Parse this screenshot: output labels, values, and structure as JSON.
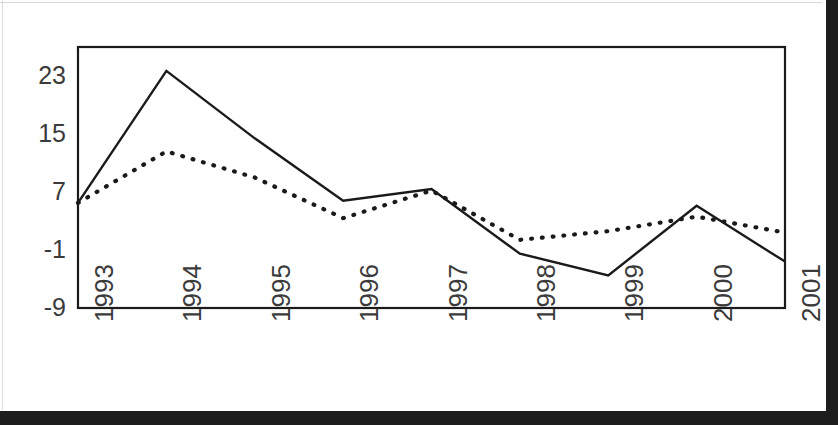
{
  "chart_data": {
    "type": "line",
    "title": "",
    "subtitle": "",
    "xlabel": "",
    "ylabel": "",
    "categories": [
      "1993",
      "1994",
      "1995",
      "1996",
      "1997",
      "1998",
      "1999",
      "2000",
      "2001"
    ],
    "series": [
      {
        "name": "solid-line-series",
        "style": "solid",
        "color": "#1a1a1a",
        "values": [
          5.5,
          23.7,
          14.4,
          5.8,
          7.4,
          -1.5,
          -4.5,
          5.1,
          -2.6
        ]
      },
      {
        "name": "dotted-line-series",
        "style": "dotted",
        "color": "#1a1a1a",
        "values": [
          5.5,
          12.6,
          9.0,
          3.4,
          7.2,
          0.4,
          1.6,
          3.6,
          1.4
        ]
      }
    ],
    "ylim": [
      -9,
      27
    ],
    "yticks": [
      -9,
      -1,
      7,
      15,
      23
    ],
    "ytick_labels": [
      "-9",
      "-1",
      "7",
      "15",
      "23"
    ],
    "xtick_labels": [
      "1993",
      "1994",
      "1995",
      "1996",
      "1997",
      "1998",
      "1999",
      "2000",
      "2001"
    ],
    "xtick_rotation": -90,
    "grid": false,
    "legend": false,
    "legend_position": "none",
    "plot_frame": true,
    "annotations": []
  },
  "axis": {
    "y_labels": [
      "23",
      "15",
      "7",
      "-1",
      "-9"
    ],
    "x_labels": [
      "1993",
      "1994",
      "1995",
      "1996",
      "1997",
      "1998",
      "1999",
      "2000",
      "2001"
    ]
  },
  "colors": {
    "ink": "#1a1a1a",
    "label_ink": "#3b3b3b",
    "page": "#ffffff",
    "scan_edge": "#1d1d1d"
  }
}
